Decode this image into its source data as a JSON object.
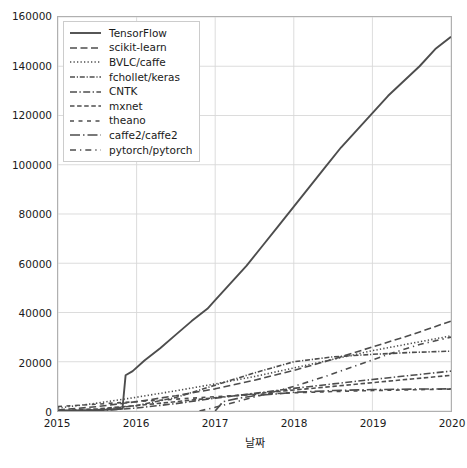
{
  "chart_data": {
    "type": "line",
    "title": "",
    "subtitle": "",
    "xlabel": "날짜",
    "ylabel": "",
    "xlim": [
      2015.0,
      2020.0
    ],
    "ylim": [
      0,
      160000
    ],
    "xticks": [
      "2015",
      "2016",
      "2017",
      "2018",
      "2019",
      "2020"
    ],
    "xtick_values": [
      2015,
      2016,
      2017,
      2018,
      2019,
      2020
    ],
    "yticks": [
      "0",
      "20000",
      "40000",
      "60000",
      "80000",
      "100000",
      "120000",
      "140000",
      "160000"
    ],
    "ytick_values": [
      0,
      20000,
      40000,
      60000,
      80000,
      100000,
      120000,
      140000,
      160000
    ],
    "grid": true,
    "grid_color": "#d8d8d8",
    "legend_position": "upper left",
    "line_color": "#4d4d4d",
    "background": "#ffffff",
    "series": [
      {
        "name": "TensorFlow",
        "style": "solid",
        "x": [
          2015.0,
          2015.3,
          2015.6,
          2015.82,
          2015.86,
          2015.95,
          2016.1,
          2016.3,
          2016.5,
          2016.7,
          2016.9,
          2017.0,
          2017.2,
          2017.4,
          2017.6,
          2017.8,
          2018.0,
          2018.2,
          2018.4,
          2018.6,
          2018.8,
          2019.0,
          2019.2,
          2019.4,
          2019.6,
          2019.8,
          2020.0
        ],
        "values": [
          0,
          200,
          500,
          900,
          14500,
          16200,
          20500,
          25500,
          31000,
          36500,
          41500,
          45000,
          52000,
          59000,
          67000,
          75000,
          83000,
          91000,
          99000,
          107000,
          114000,
          121000,
          128000,
          134000,
          140000,
          147000,
          152000
        ]
      },
      {
        "name": "scikit-learn",
        "style": "dashed",
        "x": [
          2015.0,
          2015.5,
          2016.0,
          2016.5,
          2017.0,
          2017.5,
          2018.0,
          2018.5,
          2019.0,
          2019.5,
          2020.0
        ],
        "values": [
          400,
          1800,
          3800,
          6200,
          9000,
          12500,
          16500,
          21000,
          26000,
          31000,
          36500
        ]
      },
      {
        "name": "BVLC/caffe",
        "style": "dotted",
        "x": [
          2015.0,
          2015.5,
          2016.0,
          2016.5,
          2017.0,
          2017.5,
          2018.0,
          2018.5,
          2019.0,
          2019.5,
          2020.0
        ],
        "values": [
          1200,
          3200,
          5600,
          8200,
          11000,
          14000,
          17500,
          21000,
          24500,
          27500,
          30500
        ]
      },
      {
        "name": "fchollet/keras",
        "style": "densely-dashdotted",
        "x": [
          2015.0,
          2015.5,
          2016.0,
          2016.5,
          2017.0,
          2017.5,
          2018.0,
          2018.5,
          2019.0,
          2019.5,
          2020.0
        ],
        "values": [
          0,
          500,
          2200,
          5500,
          10500,
          15500,
          20000,
          22000,
          23000,
          23800,
          24300
        ]
      },
      {
        "name": "CNTK",
        "style": "dashdot",
        "x": [
          2015.0,
          2015.5,
          2016.0,
          2016.5,
          2017.0,
          2017.5,
          2018.0,
          2018.5,
          2019.0,
          2019.5,
          2020.0
        ],
        "values": [
          0,
          100,
          1200,
          3000,
          5200,
          7200,
          9200,
          11000,
          12800,
          14500,
          16200
        ]
      },
      {
        "name": "mxnet",
        "style": "dashed-short",
        "x": [
          2015.0,
          2015.5,
          2016.0,
          2016.5,
          2017.0,
          2017.5,
          2018.0,
          2018.5,
          2019.0,
          2019.5,
          2020.0
        ],
        "values": [
          100,
          900,
          2200,
          3800,
          5400,
          7000,
          8500,
          10000,
          11500,
          13000,
          14500
        ]
      },
      {
        "name": "theano",
        "style": "loosely-dashed",
        "x": [
          2015.0,
          2015.5,
          2016.0,
          2016.5,
          2017.0,
          2017.5,
          2018.0,
          2018.5,
          2019.0,
          2019.5,
          2020.0
        ],
        "values": [
          1800,
          2800,
          3800,
          4800,
          5800,
          6700,
          7400,
          7900,
          8300,
          8600,
          8900
        ]
      },
      {
        "name": "caffe2/caffe2",
        "style": "dashdot-long",
        "x": [
          2017.0,
          2017.1,
          2017.3,
          2017.5,
          2017.8,
          2018.0,
          2018.5,
          2019.0,
          2019.5,
          2020.0
        ],
        "values": [
          0,
          3800,
          5200,
          6200,
          7000,
          7600,
          8300,
          8700,
          8900,
          9000
        ]
      },
      {
        "name": "pytorch/pytorch",
        "style": "loosely-dashdotted",
        "x": [
          2016.8,
          2017.0,
          2017.3,
          2017.6,
          2018.0,
          2018.4,
          2018.8,
          2019.2,
          2019.6,
          2020.0
        ],
        "values": [
          0,
          1500,
          4000,
          6500,
          10000,
          14000,
          18500,
          23000,
          27000,
          30000
        ]
      }
    ]
  },
  "legend": {
    "items": [
      {
        "label": "TensorFlow"
      },
      {
        "label": "scikit-learn"
      },
      {
        "label": "BVLC/caffe"
      },
      {
        "label": "fchollet/keras"
      },
      {
        "label": "CNTK"
      },
      {
        "label": "mxnet"
      },
      {
        "label": "theano"
      },
      {
        "label": "caffe2/caffe2"
      },
      {
        "label": "pytorch/pytorch"
      }
    ]
  }
}
